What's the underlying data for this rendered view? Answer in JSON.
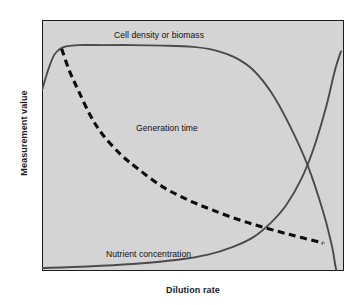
{
  "figure": {
    "background": "#ffffff",
    "plot_background": "#d4d4d4",
    "frame_color": "#1c1c1c",
    "curve_color": "#4a4a4a",
    "dashed_color": "#0d0d0d"
  },
  "axes": {
    "xlabel": "Dilution rate",
    "ylabel": "Measurement value"
  },
  "labels": {
    "cell_density": "Cell density or biomass",
    "generation_time": "Generation time",
    "nutrient_concentration": "Nutrient concentration"
  },
  "chart_data": {
    "type": "line",
    "title": "",
    "xlabel": "Dilution rate",
    "ylabel": "Measurement value",
    "xlim": [
      0,
      1
    ],
    "ylim": [
      0,
      1
    ],
    "grid": false,
    "legend": "inline-annotations",
    "axis_ticks": {
      "x": [],
      "y": []
    },
    "series": [
      {
        "name": "Cell density or biomass",
        "style": "solid",
        "color": "#4a4a4a",
        "annotation": "Cell density or biomass",
        "annotation_xy": [
          0.13,
          0.95
        ],
        "description": "Rises steeply from left edge, peaks early, long flat plateau, then falls increasingly steeply and crashes to zero at the critical dilution rate near the right edge.",
        "x": [
          0.0,
          0.02,
          0.04,
          0.06,
          0.08,
          0.12,
          0.2,
          0.3,
          0.4,
          0.5,
          0.57,
          0.64,
          0.7,
          0.76,
          0.82,
          0.88,
          0.93,
          0.96,
          0.97,
          0.975
        ],
        "y": [
          0.72,
          0.8,
          0.86,
          0.885,
          0.895,
          0.9,
          0.9,
          0.9,
          0.898,
          0.893,
          0.88,
          0.85,
          0.8,
          0.71,
          0.58,
          0.42,
          0.24,
          0.1,
          0.03,
          0.0
        ]
      },
      {
        "name": "Generation time",
        "style": "dashed",
        "color": "#0d0d0d",
        "annotation": "Generation time",
        "annotation_xy": [
          0.31,
          0.58
        ],
        "description": "Starts high at the low dilution rate, decays hyperbolically, flattening toward a low asymptote at the right.",
        "x": [
          0.065,
          0.09,
          0.12,
          0.16,
          0.2,
          0.26,
          0.32,
          0.4,
          0.48,
          0.56,
          0.65,
          0.74,
          0.83,
          0.92,
          0.93
        ],
        "y": [
          0.885,
          0.8,
          0.72,
          0.62,
          0.545,
          0.465,
          0.405,
          0.335,
          0.285,
          0.245,
          0.205,
          0.172,
          0.142,
          0.115,
          0.11
        ]
      },
      {
        "name": "Nutrient concentration",
        "style": "solid",
        "color": "#4a4a4a",
        "annotation": "Nutrient concentration",
        "annotation_xy": [
          0.08,
          0.12
        ],
        "description": "Near zero across most of the range, then rises sharply and steeply near the critical dilution rate at the right edge.",
        "x": [
          0.0,
          0.15,
          0.3,
          0.45,
          0.55,
          0.63,
          0.7,
          0.76,
          0.81,
          0.86,
          0.9,
          0.94,
          0.97,
          0.99
        ],
        "y": [
          0.012,
          0.018,
          0.028,
          0.045,
          0.065,
          0.095,
          0.135,
          0.195,
          0.265,
          0.37,
          0.49,
          0.65,
          0.8,
          0.875
        ]
      }
    ]
  }
}
